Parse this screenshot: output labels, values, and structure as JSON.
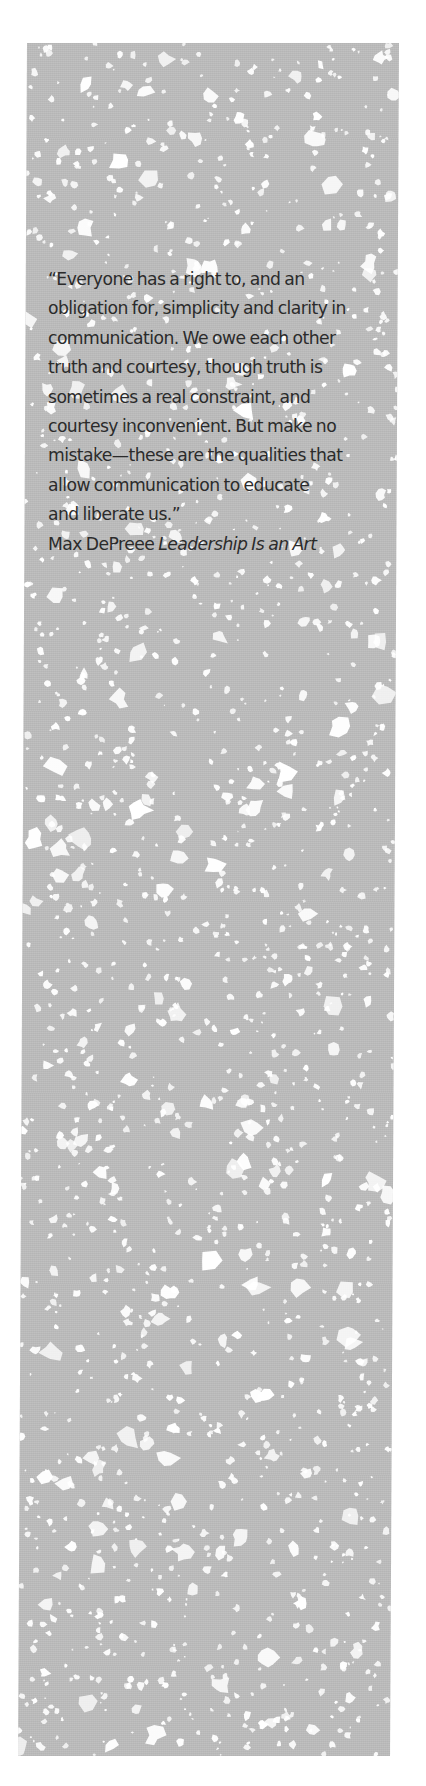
{
  "page": {
    "background_color": "#ffffff",
    "panel_color": "#bcbcbc",
    "text_color": "#2b2b2b"
  },
  "quote": {
    "lines": [
      "“Everyone has a right to, and an",
      "obligation for, simplicity and clarity in",
      "communication. We owe each other",
      "truth and courtesy, though truth is",
      "sometimes a real constraint, and",
      "courtesy inconvenient. But make no",
      "mistake—these are the qualities that",
      "allow communication to educate",
      "and liberate us.”"
    ],
    "author": "Max DePreee",
    "source_title": "Leadership Is an Art"
  },
  "decoration": {
    "texture_icon": "lace-texture-pattern"
  }
}
